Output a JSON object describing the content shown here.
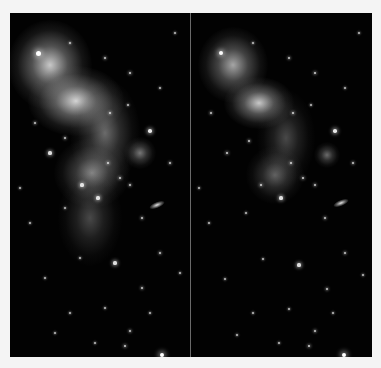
{
  "image": {
    "description": "Side-by-side comparison of two renderings of the same star-forming nebula field",
    "background_color": "#f4f4f4",
    "divider_color": "#6a6a6a",
    "panels": [
      {
        "id": "left",
        "nebula_tone": "brighter, softer glow",
        "nebulae": [
          {
            "x": 40,
            "y": 52,
            "rx": 26,
            "ry": 28,
            "alpha": 0.85
          },
          {
            "x": 66,
            "y": 88,
            "rx": 30,
            "ry": 22,
            "alpha": 0.9
          },
          {
            "x": 95,
            "y": 120,
            "rx": 22,
            "ry": 34,
            "alpha": 0.45
          },
          {
            "x": 82,
            "y": 160,
            "rx": 24,
            "ry": 22,
            "alpha": 0.55
          },
          {
            "x": 130,
            "y": 140,
            "rx": 10,
            "ry": 10,
            "alpha": 0.5
          },
          {
            "x": 80,
            "y": 205,
            "rx": 20,
            "ry": 30,
            "alpha": 0.3
          }
        ],
        "galaxy": {
          "x": 147,
          "y": 192,
          "w": 16,
          "h": 6
        },
        "stars": [
          [
            28,
            40,
            2.5
          ],
          [
            95,
            45,
            1.2
          ],
          [
            60,
            30,
            1
          ],
          [
            120,
            60,
            1.4
          ],
          [
            150,
            75,
            1
          ],
          [
            25,
            110,
            1.2
          ],
          [
            40,
            140,
            1.6
          ],
          [
            55,
            125,
            1.2
          ],
          [
            100,
            100,
            1.3
          ],
          [
            118,
            92,
            1
          ],
          [
            140,
            118,
            1.8
          ],
          [
            160,
            150,
            1.2
          ],
          [
            72,
            172,
            1.6
          ],
          [
            98,
            150,
            1.4
          ],
          [
            110,
            165,
            1.4
          ],
          [
            120,
            172,
            1.2
          ],
          [
            88,
            185,
            1.6
          ],
          [
            132,
            205,
            1.2
          ],
          [
            55,
            195,
            1
          ],
          [
            20,
            210,
            1
          ],
          [
            150,
            240,
            1.2
          ],
          [
            105,
            250,
            1.6
          ],
          [
            70,
            245,
            1
          ],
          [
            35,
            265,
            1
          ],
          [
            132,
            275,
            1.2
          ],
          [
            95,
            295,
            1
          ],
          [
            60,
            300,
            1
          ],
          [
            120,
            318,
            1.2
          ],
          [
            152,
            342,
            2.4
          ],
          [
            115,
            333,
            1.4
          ],
          [
            165,
            20,
            1
          ],
          [
            10,
            175,
            1
          ],
          [
            170,
            260,
            1
          ],
          [
            45,
            320,
            1
          ],
          [
            85,
            330,
            1
          ],
          [
            140,
            300,
            1
          ]
        ]
      },
      {
        "id": "right",
        "nebula_tone": "darker, higher contrast",
        "nebulae": [
          {
            "x": 42,
            "y": 52,
            "rx": 22,
            "ry": 24,
            "alpha": 0.7
          },
          {
            "x": 68,
            "y": 90,
            "rx": 22,
            "ry": 16,
            "alpha": 0.85
          },
          {
            "x": 95,
            "y": 125,
            "rx": 18,
            "ry": 30,
            "alpha": 0.3
          },
          {
            "x": 84,
            "y": 162,
            "rx": 18,
            "ry": 18,
            "alpha": 0.4
          },
          {
            "x": 136,
            "y": 142,
            "rx": 8,
            "ry": 8,
            "alpha": 0.45
          }
        ],
        "galaxy": {
          "x": 150,
          "y": 190,
          "w": 16,
          "h": 6
        },
        "stars": [
          [
            30,
            40,
            2.2
          ],
          [
            98,
            45,
            1.2
          ],
          [
            62,
            30,
            1
          ],
          [
            124,
            60,
            1.4
          ],
          [
            154,
            75,
            1
          ],
          [
            20,
            100,
            1.2
          ],
          [
            36,
            140,
            1.4
          ],
          [
            58,
            128,
            1.2
          ],
          [
            102,
            100,
            1.4
          ],
          [
            120,
            92,
            1
          ],
          [
            144,
            118,
            1.8
          ],
          [
            162,
            150,
            1.2
          ],
          [
            70,
            172,
            1.4
          ],
          [
            100,
            150,
            1.4
          ],
          [
            112,
            165,
            1.4
          ],
          [
            124,
            172,
            1.2
          ],
          [
            90,
            185,
            1.6
          ],
          [
            134,
            205,
            1.2
          ],
          [
            55,
            200,
            1
          ],
          [
            18,
            210,
            1
          ],
          [
            154,
            240,
            1.2
          ],
          [
            108,
            252,
            1.6
          ],
          [
            72,
            246,
            1
          ],
          [
            34,
            266,
            1
          ],
          [
            136,
            276,
            1.2
          ],
          [
            98,
            296,
            1
          ],
          [
            62,
            300,
            1
          ],
          [
            124,
            318,
            1.2
          ],
          [
            153,
            342,
            2.4
          ],
          [
            118,
            333,
            1.4
          ],
          [
            168,
            20,
            1
          ],
          [
            8,
            175,
            1
          ],
          [
            172,
            262,
            1
          ],
          [
            46,
            322,
            1
          ],
          [
            88,
            330,
            1
          ],
          [
            142,
            300,
            1
          ]
        ]
      }
    ]
  }
}
